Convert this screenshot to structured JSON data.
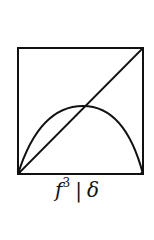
{
  "diagram": {
    "type": "return-map",
    "elements": [
      "unit-square-frame",
      "identity-diagonal",
      "unimodal-curve"
    ],
    "curve": {
      "peak_x_fraction": 0.52,
      "peak_height_fraction": 0.55
    },
    "stroke_color": "#111111"
  },
  "caption": {
    "func": "f",
    "power": "3",
    "separator": "|",
    "symbol": "δ"
  }
}
